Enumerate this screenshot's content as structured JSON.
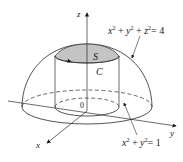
{
  "figure": {
    "axes": {
      "z_label": "z",
      "y_label": "y",
      "x_label": "x",
      "origin_label": "0"
    },
    "labels": {
      "surface": "S",
      "curve": "C"
    },
    "equations": {
      "sphere": {
        "a": "x",
        "b": "y",
        "c": "z",
        "exp": "2",
        "rhs": "= 4"
      },
      "cylinder": {
        "a": "x",
        "b": "y",
        "exp": "2",
        "rhs": "= 1"
      }
    },
    "colors": {
      "stroke": "#2a2a2a",
      "cap_fill": "#c8c8c8",
      "cap_fill_dark": "#a9a9a9"
    }
  }
}
